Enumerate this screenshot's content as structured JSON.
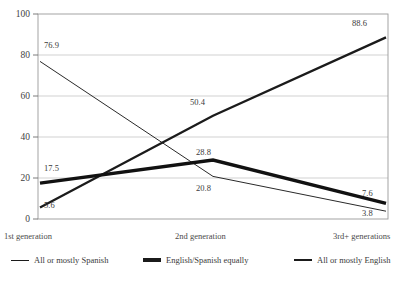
{
  "chart_data": {
    "type": "line",
    "title": "",
    "xlabel": "",
    "ylabel": "",
    "categories": [
      "1st generation",
      "2nd generation",
      "3rd+ generations"
    ],
    "ylim": [
      0,
      100
    ],
    "yticks": [
      0,
      20,
      40,
      60,
      80,
      100
    ],
    "grid": true,
    "legend_position": "bottom",
    "series": [
      {
        "name": "All or mostly Spanish",
        "values": [
          76.9,
          20.8,
          3.8
        ],
        "line_weight": "thin",
        "color": "#1b1b1b"
      },
      {
        "name": "English/Spanish equally",
        "values": [
          17.5,
          28.8,
          7.6
        ],
        "line_weight": "thick",
        "color": "#1b1b1b"
      },
      {
        "name": "All or mostly English",
        "values": [
          5.6,
          50.4,
          88.6
        ],
        "line_weight": "medium",
        "color": "#1b1b1b"
      }
    ]
  },
  "axis": {
    "y_tick_labels": [
      "100",
      "80",
      "60",
      "40",
      "20",
      "0"
    ]
  },
  "x_labels": [
    "1st generation",
    "2nd generation",
    "3rd+ generations"
  ],
  "data_labels": [
    "76.9",
    "17.5",
    "5.6",
    "50.4",
    "28.8",
    "20.8",
    "88.6",
    "7.6",
    "3.8"
  ],
  "legend": [
    "All or mostly Spanish",
    "English/Spanish equally",
    "All or mostly English"
  ]
}
